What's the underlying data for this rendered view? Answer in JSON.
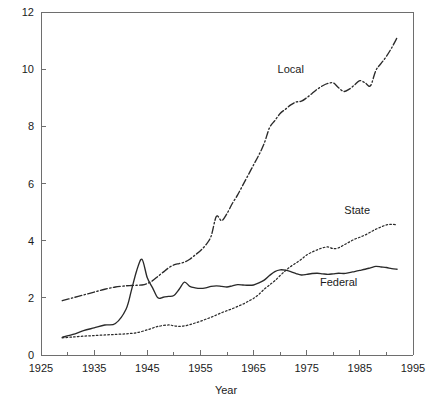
{
  "chart_data": {
    "type": "line",
    "title": "",
    "xlabel": "Year",
    "ylabel": "",
    "xlim": [
      1925,
      1995
    ],
    "ylim": [
      0,
      12
    ],
    "grid": false,
    "legend_position": "inline-annotations",
    "x_ticks": [
      "1925",
      "1935",
      "1945",
      "1955",
      "1965",
      "1975",
      "1985",
      "1995"
    ],
    "x_tick_values": [
      1925,
      1935,
      1945,
      1955,
      1965,
      1975,
      1985,
      1995
    ],
    "x_minor_tick_values": [
      1930,
      1940,
      1950,
      1960,
      1970,
      1980,
      1990
    ],
    "y_ticks": [
      "0",
      "2",
      "4",
      "6",
      "8",
      "10",
      "12"
    ],
    "y_tick_values": [
      0,
      2,
      4,
      6,
      8,
      10,
      12
    ],
    "series": [
      {
        "name": "Local",
        "line_style": "dash-dot",
        "label_text": "Local",
        "label_x": 1972.0,
        "label_y": 9.85,
        "x": [
          1929,
          1931,
          1933,
          1935,
          1937,
          1939,
          1941,
          1942,
          1943,
          1944,
          1945,
          1946,
          1947,
          1948,
          1949,
          1950,
          1951,
          1952,
          1953,
          1954,
          1955,
          1956,
          1957,
          1958,
          1959,
          1960,
          1961,
          1962,
          1963,
          1964,
          1965,
          1966,
          1967,
          1968,
          1969,
          1970,
          1971,
          1972,
          1973,
          1974,
          1975,
          1976,
          1977,
          1978,
          1979,
          1980,
          1981,
          1982,
          1983,
          1984,
          1985,
          1986,
          1987,
          1988,
          1989,
          1990,
          1991,
          1992
        ],
        "values": [
          1.9,
          2.0,
          2.1,
          2.2,
          2.3,
          2.38,
          2.42,
          2.43,
          2.44,
          2.45,
          2.5,
          2.6,
          2.75,
          2.9,
          3.05,
          3.15,
          3.2,
          3.25,
          3.35,
          3.5,
          3.65,
          3.85,
          4.15,
          4.85,
          4.7,
          4.95,
          5.3,
          5.6,
          5.95,
          6.3,
          6.65,
          7.0,
          7.4,
          7.95,
          8.2,
          8.45,
          8.6,
          8.75,
          8.85,
          8.88,
          9.0,
          9.15,
          9.3,
          9.42,
          9.5,
          9.52,
          9.35,
          9.22,
          9.3,
          9.45,
          9.6,
          9.52,
          9.42,
          9.95,
          10.2,
          10.45,
          10.75,
          11.1
        ]
      },
      {
        "name": "State",
        "line_style": "dotted",
        "label_text": "State",
        "label_x": 1984.5,
        "label_y": 4.95,
        "x": [
          1929,
          1931,
          1933,
          1935,
          1937,
          1939,
          1941,
          1943,
          1945,
          1947,
          1949,
          1950,
          1951,
          1952,
          1953,
          1954,
          1955,
          1956,
          1957,
          1958,
          1959,
          1960,
          1961,
          1962,
          1963,
          1964,
          1965,
          1966,
          1967,
          1968,
          1969,
          1970,
          1971,
          1972,
          1973,
          1974,
          1975,
          1976,
          1977,
          1978,
          1979,
          1980,
          1981,
          1982,
          1983,
          1984,
          1985,
          1986,
          1987,
          1988,
          1989,
          1990,
          1991,
          1992
        ],
        "values": [
          0.6,
          0.63,
          0.66,
          0.68,
          0.7,
          0.72,
          0.74,
          0.78,
          0.88,
          1.0,
          1.05,
          1.02,
          1.0,
          1.02,
          1.06,
          1.12,
          1.18,
          1.25,
          1.32,
          1.4,
          1.48,
          1.55,
          1.62,
          1.7,
          1.78,
          1.88,
          1.98,
          2.12,
          2.3,
          2.45,
          2.6,
          2.78,
          2.95,
          3.1,
          3.22,
          3.35,
          3.5,
          3.6,
          3.68,
          3.75,
          3.78,
          3.72,
          3.75,
          3.85,
          3.95,
          4.05,
          4.12,
          4.2,
          4.3,
          4.4,
          4.48,
          4.55,
          4.57,
          4.55
        ]
      },
      {
        "name": "Federal",
        "line_style": "solid",
        "label_text": "Federal",
        "label_x": 1981.0,
        "label_y": 2.42,
        "x": [
          1929,
          1931,
          1933,
          1935,
          1937,
          1939,
          1941,
          1942,
          1943,
          1944,
          1945,
          1946,
          1947,
          1948,
          1949,
          1950,
          1951,
          1952,
          1953,
          1954,
          1955,
          1956,
          1957,
          1958,
          1959,
          1960,
          1961,
          1962,
          1963,
          1964,
          1965,
          1966,
          1967,
          1968,
          1969,
          1970,
          1971,
          1972,
          1973,
          1974,
          1975,
          1976,
          1977,
          1978,
          1979,
          1980,
          1981,
          1982,
          1983,
          1984,
          1985,
          1986,
          1987,
          1988,
          1989,
          1990,
          1991,
          1992
        ],
        "values": [
          0.62,
          0.72,
          0.85,
          0.95,
          1.05,
          1.1,
          1.6,
          2.25,
          2.95,
          3.35,
          2.7,
          2.35,
          2.0,
          2.02,
          2.05,
          2.08,
          2.3,
          2.55,
          2.4,
          2.35,
          2.33,
          2.35,
          2.4,
          2.42,
          2.4,
          2.38,
          2.42,
          2.46,
          2.45,
          2.44,
          2.45,
          2.52,
          2.62,
          2.78,
          2.92,
          2.98,
          2.97,
          2.92,
          2.85,
          2.8,
          2.82,
          2.85,
          2.86,
          2.84,
          2.82,
          2.84,
          2.86,
          2.85,
          2.88,
          2.92,
          2.96,
          3.0,
          3.05,
          3.1,
          3.08,
          3.06,
          3.02,
          3.0
        ]
      }
    ]
  },
  "colors": {
    "axis": "#6e6e6e",
    "line": "#2a2a2a",
    "text": "#1b1b1b",
    "background": "#ffffff"
  }
}
